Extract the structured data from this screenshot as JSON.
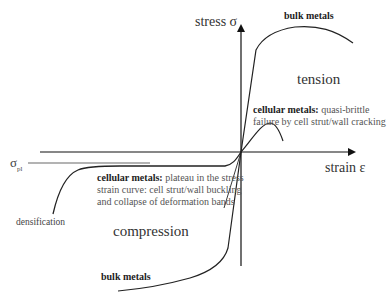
{
  "diagram": {
    "type": "stress-strain schematic",
    "axes": {
      "y_label": "stress σ",
      "x_label": "strain ε",
      "plateau_label_main": "σ",
      "plateau_label_sub": "pl"
    },
    "regions": {
      "tension": "tension",
      "compression": "compression"
    },
    "labels": {
      "bulk_metals_tension": "bulk metals",
      "bulk_metals_compression": "bulk metals",
      "cellular_tension_title": "cellular metals:",
      "cellular_tension_line1_rest": " quasi-brittle",
      "cellular_tension_line2": "failure by cell strut/wall cracking",
      "cellular_compression_title": "cellular metals:",
      "cellular_compression_line1_rest": " plateau in the stress",
      "cellular_compression_line2": "strain curve: cell strut/wall buckling",
      "cellular_compression_line3": "and collapse of deformation bands",
      "densification": "densification"
    },
    "colors": {
      "axis": "#111111",
      "curve": "#222222",
      "plateau_line": "#9a9a9a",
      "text": "#333333"
    }
  }
}
